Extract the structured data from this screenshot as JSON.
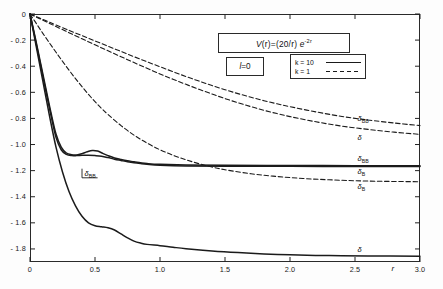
{
  "chart_data": {
    "type": "line",
    "title": "",
    "xlabel": "r",
    "ylabel": "",
    "xlim": [
      0,
      3.0
    ],
    "ylim": [
      -1.9,
      0.0
    ],
    "grid": false,
    "xticks": [
      "0",
      "0.5",
      "1.0",
      "1.5",
      "2.0",
      "2.5",
      "3.0"
    ],
    "xtick_values": [
      0,
      0.5,
      1.0,
      1.5,
      2.0,
      2.5,
      3.0
    ],
    "yticks": [
      "0",
      "- 0.2",
      "- 0.4",
      "- 0.6",
      "- 0.8",
      "- 1.0",
      "- 1.2",
      "- 1.4",
      "- 1.6",
      "- 1.8"
    ],
    "ytick_values": [
      0,
      -0.2,
      -0.4,
      -0.6,
      -0.8,
      -1.0,
      -1.2,
      -1.4,
      -1.6,
      -1.8
    ],
    "annotations": {
      "potential": "V (r) = (20/r) e^-2r",
      "partial_wave": "l = 0"
    },
    "legend": {
      "position": "upper-right",
      "entries": [
        {
          "name": "k = 10",
          "style": "solid"
        },
        {
          "name": "k = 1",
          "style": "dashed"
        }
      ]
    },
    "series": [
      {
        "name": "delta_BB_k1",
        "label": "δ_BB",
        "k": 1,
        "style": "dashed",
        "asymptote": -0.855,
        "x": [
          0,
          0.05,
          0.1,
          0.15,
          0.2,
          0.3,
          0.4,
          0.5,
          0.6,
          0.7,
          0.8,
          0.9,
          1.0,
          1.1,
          1.2,
          1.3,
          1.4,
          1.5,
          1.6,
          1.7,
          1.8,
          1.9,
          2.0,
          2.2,
          2.4,
          2.6,
          2.8,
          3.0
        ],
        "y": [
          0,
          -0.021,
          -0.042,
          -0.063,
          -0.084,
          -0.125,
          -0.166,
          -0.206,
          -0.247,
          -0.287,
          -0.327,
          -0.366,
          -0.404,
          -0.442,
          -0.479,
          -0.514,
          -0.548,
          -0.58,
          -0.61,
          -0.638,
          -0.664,
          -0.688,
          -0.71,
          -0.75,
          -0.785,
          -0.812,
          -0.835,
          -0.855
        ]
      },
      {
        "name": "delta_k1",
        "label": "δ",
        "k": 1,
        "style": "dashed",
        "asymptote": -0.922,
        "x": [
          0,
          0.05,
          0.1,
          0.15,
          0.2,
          0.3,
          0.4,
          0.5,
          0.6,
          0.7,
          0.8,
          0.9,
          1.0,
          1.1,
          1.2,
          1.3,
          1.4,
          1.5,
          1.6,
          1.7,
          1.8,
          1.9,
          2.0,
          2.2,
          2.4,
          2.6,
          2.8,
          3.0
        ],
        "y": [
          0,
          -0.024,
          -0.048,
          -0.072,
          -0.096,
          -0.143,
          -0.19,
          -0.236,
          -0.282,
          -0.327,
          -0.372,
          -0.416,
          -0.459,
          -0.5,
          -0.539,
          -0.577,
          -0.613,
          -0.648,
          -0.68,
          -0.71,
          -0.738,
          -0.763,
          -0.786,
          -0.826,
          -0.859,
          -0.884,
          -0.905,
          -0.922
        ]
      },
      {
        "name": "delta_B_k1",
        "label": "δ_B",
        "k": 1,
        "style": "dashed",
        "asymptote": -1.285,
        "x": [
          0,
          0.05,
          0.1,
          0.15,
          0.2,
          0.25,
          0.3,
          0.35,
          0.4,
          0.45,
          0.5,
          0.55,
          0.6,
          0.7,
          0.8,
          0.9,
          1.0,
          1.1,
          1.2,
          1.3,
          1.4,
          1.5,
          1.7,
          1.9,
          2.1,
          2.3,
          2.6,
          3.0
        ],
        "y": [
          0,
          -0.075,
          -0.15,
          -0.222,
          -0.293,
          -0.362,
          -0.43,
          -0.495,
          -0.557,
          -0.616,
          -0.672,
          -0.723,
          -0.77,
          -0.855,
          -0.928,
          -0.989,
          -1.04,
          -1.082,
          -1.117,
          -1.147,
          -1.172,
          -1.193,
          -1.224,
          -1.245,
          -1.26,
          -1.27,
          -1.28,
          -1.285
        ]
      },
      {
        "name": "delta_BB_k10",
        "label": "δ_BB",
        "k": 10,
        "style": "solid",
        "asymptote": -1.162,
        "x": [
          0,
          0.04,
          0.08,
          0.12,
          0.16,
          0.2,
          0.24,
          0.28,
          0.32,
          0.36,
          0.4,
          0.44,
          0.48,
          0.52,
          0.56,
          0.6,
          0.65,
          0.7,
          0.75,
          0.8,
          0.85,
          0.9,
          1.0,
          1.2,
          1.5,
          2.0,
          2.5,
          3.0
        ],
        "y": [
          0,
          -0.18,
          -0.37,
          -0.56,
          -0.75,
          -0.92,
          -1.02,
          -1.065,
          -1.078,
          -1.08,
          -1.07,
          -1.055,
          -1.045,
          -1.05,
          -1.068,
          -1.085,
          -1.103,
          -1.115,
          -1.125,
          -1.132,
          -1.14,
          -1.146,
          -1.152,
          -1.156,
          -1.159,
          -1.161,
          -1.162,
          -1.162
        ]
      },
      {
        "name": "delta_B_k10",
        "label": "δ_B",
        "k": 10,
        "style": "solid",
        "asymptote": -1.168,
        "x": [
          0,
          0.04,
          0.08,
          0.12,
          0.16,
          0.2,
          0.24,
          0.28,
          0.32,
          0.36,
          0.4,
          0.45,
          0.5,
          0.55,
          0.6,
          0.65,
          0.7,
          0.75,
          0.8,
          0.85,
          0.9,
          1.0,
          1.2,
          1.5,
          2.0,
          2.5,
          3.0
        ],
        "y": [
          0,
          -0.19,
          -0.385,
          -0.58,
          -0.77,
          -0.945,
          -1.04,
          -1.075,
          -1.085,
          -1.085,
          -1.083,
          -1.082,
          -1.085,
          -1.09,
          -1.1,
          -1.112,
          -1.122,
          -1.132,
          -1.14,
          -1.146,
          -1.151,
          -1.158,
          -1.164,
          -1.166,
          -1.167,
          -1.168,
          -1.168
        ]
      },
      {
        "name": "delta_k10",
        "label": "δ",
        "k": 10,
        "style": "solid",
        "asymptote": -1.855,
        "x": [
          0,
          0.05,
          0.1,
          0.15,
          0.2,
          0.25,
          0.3,
          0.35,
          0.4,
          0.45,
          0.5,
          0.55,
          0.6,
          0.65,
          0.7,
          0.75,
          0.8,
          0.85,
          0.9,
          1.0,
          1.1,
          1.2,
          1.4,
          1.6,
          1.8,
          2.0,
          2.3,
          2.6,
          3.0
        ],
        "y": [
          0,
          -0.26,
          -0.52,
          -0.78,
          -1.02,
          -1.21,
          -1.36,
          -1.47,
          -1.55,
          -1.6,
          -1.622,
          -1.63,
          -1.638,
          -1.655,
          -1.685,
          -1.715,
          -1.74,
          -1.755,
          -1.765,
          -1.775,
          -1.787,
          -1.798,
          -1.815,
          -1.828,
          -1.838,
          -1.845,
          -1.851,
          -1.854,
          -1.855
        ]
      }
    ],
    "curve_labels": [
      {
        "id": "label-bb-k1",
        "text": "δ",
        "sub": "BB",
        "x": 2.52,
        "y": -0.805
      },
      {
        "id": "label-delta-k1",
        "text": "δ",
        "sub": "",
        "x": 2.52,
        "y": -0.952
      },
      {
        "id": "label-bb-k10",
        "text": "δ",
        "sub": "BB",
        "x": 2.52,
        "y": -1.108
      },
      {
        "id": "label-b-k10",
        "text": "δ",
        "sub": "B",
        "x": 2.52,
        "y": -1.208
      },
      {
        "id": "label-b-k1",
        "text": "δ",
        "sub": "B",
        "x": 2.52,
        "y": -1.325
      },
      {
        "id": "label-delta-k10",
        "text": "δ",
        "sub": "",
        "x": 2.52,
        "y": -1.81
      },
      {
        "id": "label-bb-inner",
        "text": "δ",
        "sub": "BB",
        "x": 0.42,
        "y": -1.225
      }
    ]
  },
  "labels": {
    "formula_v": "V",
    "formula_r1": "(r)",
    "formula_eq": "=",
    "formula_frac": "(20/r)",
    "formula_exp_base": "e",
    "formula_exp": "-2r",
    "l_symbol": "l",
    "l_value": "=0",
    "axis_r": "r"
  }
}
